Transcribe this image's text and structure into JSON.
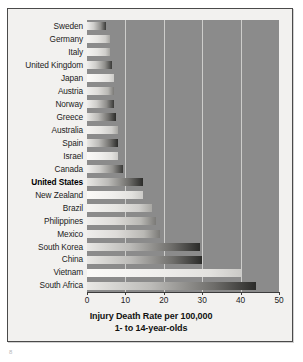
{
  "chart_data": {
    "type": "bar",
    "orientation": "horizontal",
    "title": "",
    "xlabel": "Injury Death Rate per 100,000",
    "xlabel_line2": "1- to 14-year-olds",
    "ylabel": "",
    "xlim": [
      0,
      50
    ],
    "xticks": [
      0,
      10,
      20,
      30,
      40,
      50
    ],
    "grid": true,
    "gridlines_at": [
      10,
      20,
      30,
      40
    ],
    "legend": "none",
    "highlight_category": "United States",
    "categories": [
      "Sweden",
      "Germany",
      "Italy",
      "United Kingdom",
      "Japan",
      "Austria",
      "Norway",
      "Greece",
      "Australia",
      "Spain",
      "Israel",
      "Canada",
      "United States",
      "New Zealand",
      "Brazil",
      "Philippines",
      "Mexico",
      "South Korea",
      "China",
      "Vietnam",
      "South Africa"
    ],
    "values": [
      5,
      6,
      6,
      6.5,
      7,
      7,
      7,
      7.5,
      8,
      8,
      8,
      9.5,
      14.5,
      14.5,
      17,
      18,
      19,
      29.5,
      30,
      40,
      44
    ],
    "bar_tones": [
      "tone-a",
      "tone-c",
      "tone-c",
      "tone-a",
      "tone-d",
      "tone-b",
      "tone-a",
      "tone-e",
      "tone-c",
      "tone-e",
      "tone-d",
      "tone-a",
      "tone-e",
      "tone-d",
      "tone-c",
      "tone-b",
      "tone-b",
      "tone-e",
      "tone-e",
      "tone-d",
      "tone-e"
    ]
  },
  "footer": {
    "mark": "8"
  },
  "colors": {
    "plot_background": "#8b8b8b",
    "gridline": "#d8d8d6",
    "frame_border": "#4a4a4a",
    "figure_background": "#f2f1ef",
    "axis_text": "#1c1c1c"
  }
}
